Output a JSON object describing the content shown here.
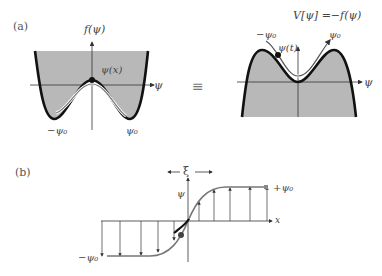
{
  "panel_a": {
    "label": "(a)",
    "left_plot": {
      "y_axis_label": "f(ψ)",
      "x_axis_label": "ψ",
      "trajectory_label": "ψ(x)",
      "left_min_label": "−ψ₀",
      "right_min_label": "ψ₀"
    },
    "equivalence_symbol": "≡",
    "right_plot": {
      "title": "V[ψ] =−f(ψ)",
      "x_axis_label": "ψ",
      "trajectory_label": "ψ(t)",
      "left_peak_label": "−ψ₀",
      "right_peak_label": "ψ₀"
    }
  },
  "panel_b": {
    "label": "(b)",
    "width_label": "ξ",
    "y_axis_label": "ψ",
    "x_axis_label": "x",
    "upper_asymptote_label": "+ψ₀",
    "lower_asymptote_label": "−ψ₀"
  },
  "colors": {
    "fill": "#b8b8b8",
    "curve": "#111111",
    "trajectory": "#777777",
    "axis": "#333333"
  }
}
